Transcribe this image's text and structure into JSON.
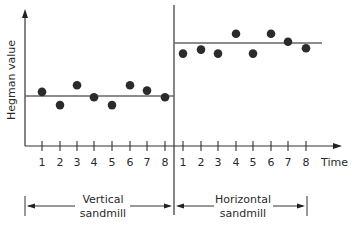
{
  "chart_data": {
    "type": "scatter",
    "title": "",
    "xlabel": "Time",
    "ylabel": "Hegman value",
    "grid": false,
    "legend": "none",
    "ylim": [
      0,
      10
    ],
    "series": [
      {
        "name": "Vertical sandmill",
        "x": [
          1,
          2,
          3,
          4,
          5,
          6,
          7,
          8
        ],
        "values": [
          4.1,
          3.1,
          4.6,
          3.7,
          3.1,
          4.6,
          4.2,
          3.7
        ],
        "mean": 3.9
      },
      {
        "name": "Horizontal sandmill",
        "x": [
          1,
          2,
          3,
          4,
          5,
          6,
          7,
          8
        ],
        "values": [
          7.0,
          7.3,
          7.0,
          8.5,
          7.0,
          8.5,
          7.9,
          7.4
        ],
        "mean": 7.6
      }
    ],
    "tick_labels": [
      "1",
      "2",
      "3",
      "4",
      "5",
      "6",
      "7",
      "8"
    ],
    "annotations": [
      "Vertical sandmill",
      "Horizontal sandmill"
    ]
  },
  "labels": {
    "y_axis": "Hegman value",
    "x_axis": "Time",
    "group_left_line1": "Vertical",
    "group_left_line2": "sandmill",
    "group_right_line1": "Horizontal",
    "group_right_line2": "sandmill",
    "ticks": [
      "1",
      "2",
      "3",
      "4",
      "5",
      "6",
      "7",
      "8"
    ]
  }
}
